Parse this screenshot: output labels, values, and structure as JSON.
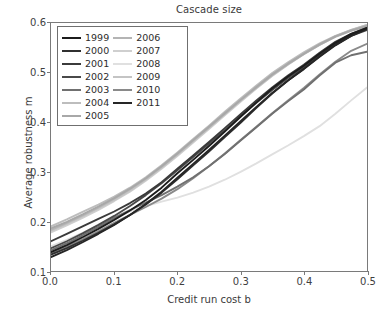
{
  "chart_data": {
    "type": "line",
    "title": "Cascade size",
    "xlabel": "Credit run cost b",
    "ylabel": "Average robustness m",
    "xlim": [
      0.0,
      0.5
    ],
    "ylim": [
      0.1,
      0.6
    ],
    "xticks": [
      "0.0",
      "0.1",
      "0.2",
      "0.3",
      "0.4",
      "0.5"
    ],
    "xtick_values": [
      0.0,
      0.1,
      0.2,
      0.3,
      0.4,
      0.5
    ],
    "yticks": [
      "0.1",
      "0.2",
      "0.3",
      "0.4",
      "0.5",
      "0.6"
    ],
    "ytick_values": [
      0.1,
      0.2,
      0.3,
      0.4,
      0.5,
      0.6
    ],
    "grid": false,
    "legend_position": "upper left",
    "legend_columns": 2,
    "x": [
      0.0,
      0.025,
      0.05,
      0.075,
      0.1,
      0.125,
      0.15,
      0.175,
      0.2,
      0.225,
      0.25,
      0.275,
      0.3,
      0.325,
      0.35,
      0.375,
      0.4,
      0.425,
      0.45,
      0.475,
      0.5
    ],
    "series": [
      {
        "name": "1999",
        "color": "#1c1c1c",
        "values": [
          0.138,
          0.152,
          0.168,
          0.185,
          0.203,
          0.222,
          0.243,
          0.268,
          0.297,
          0.324,
          0.352,
          0.381,
          0.411,
          0.44,
          0.468,
          0.492,
          0.514,
          0.538,
          0.56,
          0.578,
          0.59
        ]
      },
      {
        "name": "2000",
        "color": "#303030",
        "values": [
          0.133,
          0.146,
          0.161,
          0.177,
          0.194,
          0.213,
          0.234,
          0.258,
          0.285,
          0.313,
          0.341,
          0.37,
          0.399,
          0.429,
          0.458,
          0.484,
          0.508,
          0.533,
          0.556,
          0.575,
          0.588
        ]
      },
      {
        "name": "2001",
        "color": "#3b3b3b",
        "values": [
          0.16,
          0.175,
          0.19,
          0.205,
          0.22,
          0.237,
          0.256,
          0.279,
          0.306,
          0.333,
          0.36,
          0.388,
          0.416,
          0.444,
          0.47,
          0.494,
          0.516,
          0.54,
          0.562,
          0.578,
          0.59
        ]
      },
      {
        "name": "2002",
        "color": "#4a4a4a",
        "values": [
          0.146,
          0.16,
          0.176,
          0.193,
          0.211,
          0.231,
          0.253,
          0.277,
          0.303,
          0.33,
          0.357,
          0.384,
          0.412,
          0.439,
          0.465,
          0.489,
          0.511,
          0.535,
          0.557,
          0.574,
          0.586
        ]
      },
      {
        "name": "2003",
        "color": "#707070",
        "values": [
          0.142,
          0.156,
          0.172,
          0.189,
          0.207,
          0.223,
          0.238,
          0.253,
          0.27,
          0.289,
          0.311,
          0.336,
          0.363,
          0.39,
          0.417,
          0.442,
          0.466,
          0.494,
          0.52,
          0.535,
          0.542
        ]
      },
      {
        "name": "2004",
        "color": "#bdbdbd",
        "values": [
          0.19,
          0.204,
          0.219,
          0.234,
          0.25,
          0.268,
          0.289,
          0.313,
          0.339,
          0.366,
          0.393,
          0.421,
          0.448,
          0.474,
          0.499,
          0.521,
          0.541,
          0.559,
          0.574,
          0.586,
          0.596
        ]
      },
      {
        "name": "2005",
        "color": "#a8a8a8",
        "values": [
          0.186,
          0.199,
          0.214,
          0.23,
          0.247,
          0.266,
          0.287,
          0.311,
          0.337,
          0.364,
          0.391,
          0.418,
          0.445,
          0.471,
          0.496,
          0.518,
          0.538,
          0.557,
          0.573,
          0.585,
          0.594
        ]
      },
      {
        "name": "2006",
        "color": "#b4b4b4",
        "values": [
          0.183,
          0.197,
          0.212,
          0.228,
          0.246,
          0.265,
          0.286,
          0.31,
          0.336,
          0.363,
          0.39,
          0.417,
          0.444,
          0.47,
          0.495,
          0.517,
          0.537,
          0.556,
          0.572,
          0.584,
          0.593
        ]
      },
      {
        "name": "2007",
        "color": "#cfcfcf",
        "values": [
          0.178,
          0.192,
          0.207,
          0.223,
          0.241,
          0.26,
          0.282,
          0.306,
          0.332,
          0.359,
          0.386,
          0.414,
          0.441,
          0.468,
          0.493,
          0.516,
          0.537,
          0.556,
          0.573,
          0.586,
          0.596
        ]
      },
      {
        "name": "2008",
        "color": "#e0e0e0",
        "values": [
          0.15,
          0.163,
          0.177,
          0.192,
          0.207,
          0.22,
          0.231,
          0.24,
          0.248,
          0.258,
          0.27,
          0.284,
          0.3,
          0.317,
          0.335,
          0.353,
          0.372,
          0.392,
          0.417,
          0.444,
          0.47
        ]
      },
      {
        "name": "2009",
        "color": "#c4c4c4",
        "values": [
          0.181,
          0.195,
          0.21,
          0.226,
          0.243,
          0.262,
          0.284,
          0.308,
          0.334,
          0.361,
          0.388,
          0.416,
          0.443,
          0.469,
          0.494,
          0.517,
          0.538,
          0.557,
          0.573,
          0.585,
          0.595
        ]
      },
      {
        "name": "2010",
        "color": "#8a8a8a",
        "values": [
          0.136,
          0.149,
          0.164,
          0.18,
          0.197,
          0.213,
          0.229,
          0.246,
          0.265,
          0.287,
          0.311,
          0.337,
          0.364,
          0.391,
          0.418,
          0.444,
          0.469,
          0.496,
          0.522,
          0.544,
          0.558
        ]
      },
      {
        "name": "2011",
        "color": "#262626",
        "values": [
          0.128,
          0.142,
          0.158,
          0.175,
          0.193,
          0.213,
          0.235,
          0.26,
          0.288,
          0.316,
          0.344,
          0.373,
          0.402,
          0.431,
          0.459,
          0.484,
          0.507,
          0.532,
          0.555,
          0.574,
          0.588
        ]
      }
    ]
  },
  "legend": {
    "column_left": [
      "1999",
      "2000",
      "2001",
      "2002",
      "2003",
      "2004",
      "2005"
    ],
    "column_right": [
      "2006",
      "2007",
      "2008",
      "2009",
      "2010",
      "2011"
    ]
  }
}
